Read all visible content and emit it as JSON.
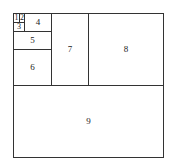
{
  "diagram": {
    "type": "fibonacci-square-tiling",
    "cells": [
      {
        "label": "1",
        "x": 13,
        "y": 13,
        "w": 7,
        "h": 10,
        "fs": 8
      },
      {
        "label": "2",
        "x": 19,
        "y": 13,
        "w": 6,
        "h": 10,
        "fs": 8
      },
      {
        "label": "3",
        "x": 13,
        "y": 22,
        "w": 12,
        "h": 10,
        "fs": 8
      },
      {
        "label": "4",
        "x": 24,
        "y": 13,
        "w": 28,
        "h": 19,
        "fs": 9
      },
      {
        "label": "5",
        "x": 13,
        "y": 31,
        "w": 39,
        "h": 19,
        "fs": 9
      },
      {
        "label": "6",
        "x": 13,
        "y": 49,
        "w": 39,
        "h": 37,
        "fs": 9
      },
      {
        "label": "7",
        "x": 51,
        "y": 13,
        "w": 38,
        "h": 73,
        "fs": 9
      },
      {
        "label": "8",
        "x": 88,
        "y": 13,
        "w": 76,
        "h": 73,
        "fs": 9
      },
      {
        "label": "9",
        "x": 13,
        "y": 85,
        "w": 151,
        "h": 73,
        "fs": 9
      }
    ]
  }
}
